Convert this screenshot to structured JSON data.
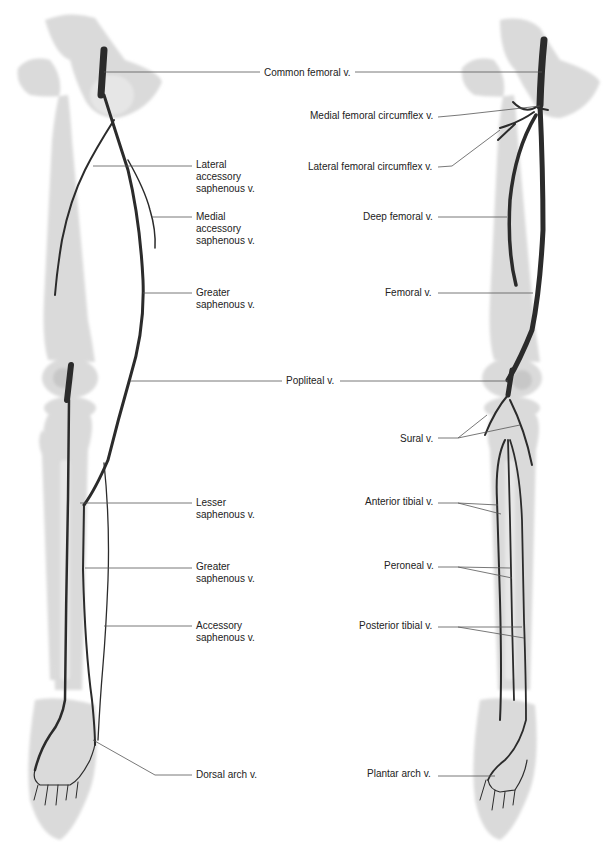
{
  "diagram": {
    "type": "anatomical illustration",
    "colors": {
      "background": "#ffffff",
      "bone": "#d9d9d9",
      "bone_shadow": "#c4c4c4",
      "vein": "#2b2b2b",
      "leader": "#555555",
      "text": "#222222"
    },
    "left_view": {
      "labels": [
        {
          "id": "common-femoral",
          "text": "Common femoral v.",
          "x": 264,
          "y": 67
        },
        {
          "id": "lateral-accessory-saphenous",
          "text": "Lateral\naccessory\nsaphenous v.",
          "x": 196,
          "y": 159
        },
        {
          "id": "medial-accessory-saphenous",
          "text": "Medial\naccessory\nsaphenous v.",
          "x": 196,
          "y": 211
        },
        {
          "id": "greater-saphenous-thigh",
          "text": "Greater\nsaphenous v.",
          "x": 196,
          "y": 287
        },
        {
          "id": "popliteal",
          "text": "Popliteal v.",
          "x": 286,
          "y": 375
        },
        {
          "id": "lesser-saphenous",
          "text": "Lesser\nsaphenous v.",
          "x": 196,
          "y": 497
        },
        {
          "id": "greater-saphenous-leg",
          "text": "Greater\nsaphenous v.",
          "x": 196,
          "y": 561
        },
        {
          "id": "accessory-saphenous",
          "text": "Accessory\nsaphenous v.",
          "x": 196,
          "y": 620
        },
        {
          "id": "dorsal-arch",
          "text": "Dorsal arch v.",
          "x": 196,
          "y": 769
        }
      ]
    },
    "right_view": {
      "labels": [
        {
          "id": "medial-femoral-circumflex",
          "text": "Medial femoral circumflex v.",
          "x": 310,
          "y": 110
        },
        {
          "id": "lateral-femoral-circumflex",
          "text": "Lateral femoral circumflex v.",
          "x": 308,
          "y": 161
        },
        {
          "id": "deep-femoral",
          "text": "Deep femoral v.",
          "x": 363,
          "y": 211
        },
        {
          "id": "femoral",
          "text": "Femoral v.",
          "x": 385,
          "y": 287
        },
        {
          "id": "sural",
          "text": "Sural v.",
          "x": 400,
          "y": 433
        },
        {
          "id": "anterior-tibial",
          "text": "Anterior tibial v.",
          "x": 365,
          "y": 496
        },
        {
          "id": "peroneal",
          "text": "Peroneal v.",
          "x": 384,
          "y": 560
        },
        {
          "id": "posterior-tibial",
          "text": "Posterior tibial v.",
          "x": 359,
          "y": 620
        },
        {
          "id": "plantar-arch",
          "text": "Plantar arch v.",
          "x": 367,
          "y": 768
        }
      ]
    }
  }
}
